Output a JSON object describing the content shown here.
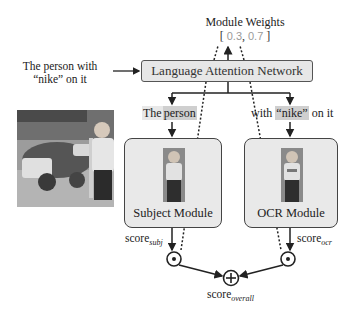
{
  "diagram": {
    "module_weights": {
      "title": "Module Weights",
      "open_bracket": "[",
      "close_bracket": "]",
      "separator": ",",
      "values": [
        "0.3",
        "0.7"
      ]
    },
    "query": {
      "line1": "The person with",
      "line2": "“nike” on it"
    },
    "language_attention_network": {
      "label": "Language Attention Network"
    },
    "phrases": {
      "subject": {
        "prefix": "The",
        "highlight": "person"
      },
      "ocr": {
        "prefix": "with",
        "highlight": "“nike”",
        "suffix": "on it"
      }
    },
    "modules": [
      {
        "label": "Subject Module"
      },
      {
        "label": "OCR Module"
      }
    ],
    "scores": {
      "subject": {
        "base": "score",
        "sub": "subj"
      },
      "ocr": {
        "base": "score",
        "sub": "ocr"
      },
      "overall": {
        "base": "score",
        "sub": "overall"
      }
    },
    "operators": {
      "multiply": "dot-product-circle",
      "sum": "circled-plus"
    },
    "colors": {
      "box_fill": "#e7e7e7",
      "box_border": "#555555",
      "weight_text": "#9a9a9a",
      "highlight_light": "#e8e8e8",
      "highlight_dark": "#cfcfcf",
      "line": "#222222"
    }
  }
}
